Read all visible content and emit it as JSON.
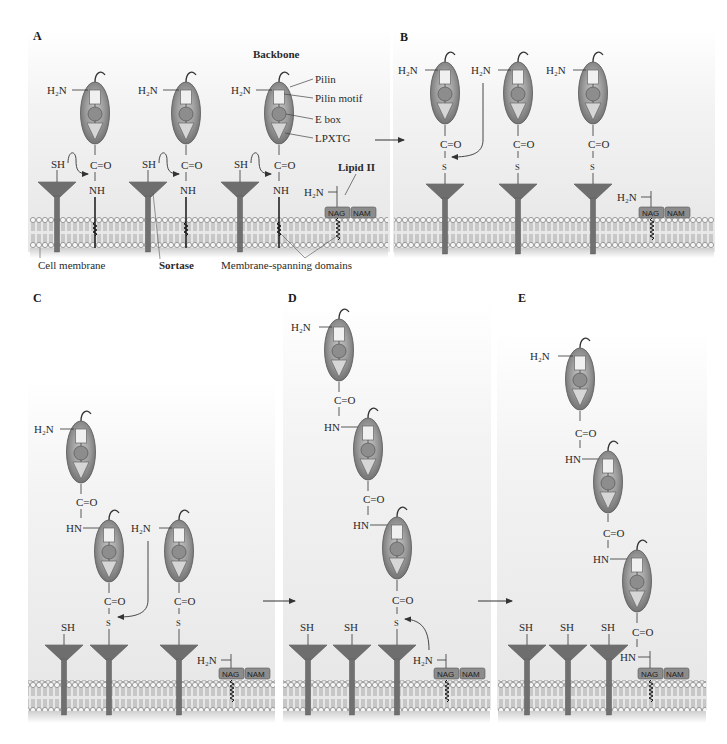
{
  "figure": {
    "colors": {
      "pilin_fill": "#8a8a8a",
      "pilin_light": "#bdbdbd",
      "sortase": "#6e6e6e",
      "membrane_bead": "#f4f4f4",
      "membrane_stroke": "#777777",
      "glyco_box": "#8c8c8c",
      "text": "#2a2a2a",
      "panel_bg": "#ececec"
    }
  },
  "panels": {
    "A": {
      "letter": "A",
      "title": "Backbone",
      "legend": [
        "Pilin",
        "Pilin motif",
        "E box",
        "LPXTG"
      ],
      "lipid_label": "Lipid II",
      "bottom_labels": {
        "cell_membrane": "Cell membrane",
        "sortase": "Sortase",
        "membrane_spanning": "Membrane-spanning domains"
      }
    },
    "B": {
      "letter": "B"
    },
    "C": {
      "letter": "C"
    },
    "D": {
      "letter": "D"
    },
    "E": {
      "letter": "E"
    }
  },
  "chem": {
    "h2n": "H₂N",
    "hn": "HN",
    "nh": "NH",
    "sh": "SH",
    "s": "S",
    "co": "C=O",
    "nag": "NAG",
    "nam": "NAM"
  }
}
